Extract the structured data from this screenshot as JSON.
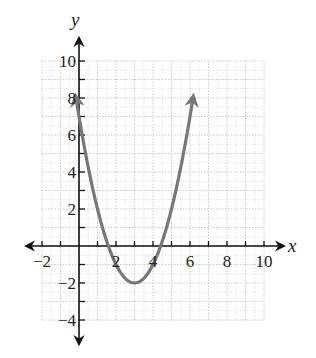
{
  "chart_data": {
    "type": "line",
    "title": "",
    "xlabel": "x",
    "ylabel": "y",
    "xlim": [
      -2,
      10
    ],
    "ylim": [
      -4,
      10
    ],
    "grid": true,
    "grid_step": 1,
    "x_ticks": [
      -2,
      2,
      4,
      6,
      8,
      10
    ],
    "x_tick_labels": [
      "−2",
      "2",
      "4",
      "6",
      "8",
      "10"
    ],
    "y_ticks": [
      -4,
      -2,
      2,
      4,
      6,
      8,
      10
    ],
    "y_tick_labels": [
      "−4",
      "−2",
      "2",
      "4",
      "6",
      "8",
      "10"
    ],
    "series": [
      {
        "name": "parabola",
        "equation": "y = (x - 3)^2 - 2",
        "vertex": [
          3,
          -2
        ],
        "y_intercept": 7,
        "x_intercepts": [
          1.59,
          4.41
        ],
        "x_range": [
          -0.16,
          6.16
        ],
        "both_ends_arrows": true,
        "color": "#777777"
      }
    ],
    "legend": null
  },
  "colors": {
    "axis": "#111111",
    "grid": "#c8c8c8",
    "curve": "#777777"
  }
}
